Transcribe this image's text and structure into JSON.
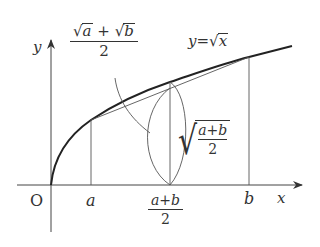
{
  "diagram": {
    "curve_label": {
      "lhs": "y",
      "eq": "=",
      "radicand": "x"
    },
    "axes": {
      "x_label": "x",
      "y_label": "y",
      "origin_label": "O"
    },
    "x_ticks": {
      "a": "a",
      "b": "b",
      "mid_num": "a+b",
      "mid_den": "2"
    },
    "top_fraction": {
      "term1": "a",
      "plus": "+",
      "term2": "b",
      "den": "2"
    },
    "right_fraction": {
      "num": "a+b",
      "den": "2"
    },
    "colors": {
      "ink": "#333333",
      "background": "#ffffff"
    }
  }
}
